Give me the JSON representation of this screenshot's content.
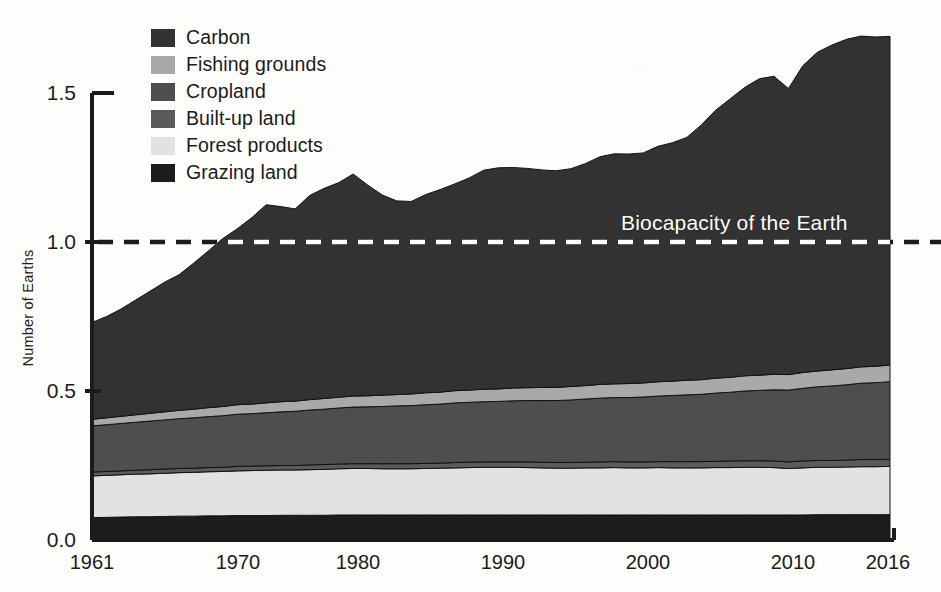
{
  "chart_data": {
    "type": "area",
    "stacked": true,
    "title": "",
    "xlabel": "",
    "ylabel": "Number of Earths",
    "xlim": [
      1961,
      2016
    ],
    "ylim": [
      0.0,
      1.75
    ],
    "yticks": [
      "0.0",
      "0.5",
      "1.0",
      "1.5"
    ],
    "ytick_values": [
      0.0,
      0.5,
      1.0,
      1.5
    ],
    "xticks": [
      "1961",
      "1970",
      "1980",
      "1990",
      "2000",
      "2010",
      "2016"
    ],
    "xtick_values": [
      1961,
      1970,
      1980,
      1990,
      2000,
      2010,
      2016
    ],
    "grid": false,
    "legend_position": "top-left",
    "x": [
      1961,
      1962,
      1963,
      1964,
      1965,
      1966,
      1967,
      1968,
      1969,
      1970,
      1971,
      1972,
      1973,
      1974,
      1975,
      1976,
      1977,
      1978,
      1979,
      1980,
      1981,
      1982,
      1983,
      1984,
      1985,
      1986,
      1987,
      1988,
      1989,
      1990,
      1991,
      1992,
      1993,
      1994,
      1995,
      1996,
      1997,
      1998,
      1999,
      2000,
      2001,
      2002,
      2003,
      2004,
      2005,
      2006,
      2007,
      2008,
      2009,
      2010,
      2011,
      2012,
      2013,
      2014,
      2015,
      2016
    ],
    "series": [
      {
        "name": "Grazing land",
        "color": "#1c1c1c",
        "values": [
          0.075,
          0.076,
          0.077,
          0.078,
          0.078,
          0.079,
          0.08,
          0.08,
          0.081,
          0.081,
          0.082,
          0.082,
          0.082,
          0.083,
          0.083,
          0.083,
          0.083,
          0.084,
          0.084,
          0.084,
          0.084,
          0.084,
          0.084,
          0.084,
          0.084,
          0.084,
          0.084,
          0.084,
          0.084,
          0.084,
          0.084,
          0.084,
          0.084,
          0.084,
          0.084,
          0.084,
          0.084,
          0.084,
          0.084,
          0.084,
          0.084,
          0.084,
          0.084,
          0.084,
          0.084,
          0.084,
          0.084,
          0.084,
          0.084,
          0.084,
          0.085,
          0.085,
          0.085,
          0.085,
          0.085,
          0.085
        ]
      },
      {
        "name": "Forest products",
        "color": "#e2e2e0",
        "values": [
          0.14,
          0.141,
          0.142,
          0.143,
          0.144,
          0.145,
          0.146,
          0.147,
          0.148,
          0.149,
          0.15,
          0.151,
          0.152,
          0.152,
          0.152,
          0.153,
          0.154,
          0.155,
          0.156,
          0.156,
          0.155,
          0.155,
          0.155,
          0.156,
          0.157,
          0.158,
          0.159,
          0.16,
          0.16,
          0.16,
          0.159,
          0.158,
          0.157,
          0.157,
          0.158,
          0.158,
          0.159,
          0.158,
          0.158,
          0.159,
          0.158,
          0.158,
          0.158,
          0.159,
          0.159,
          0.16,
          0.16,
          0.159,
          0.156,
          0.158,
          0.159,
          0.159,
          0.16,
          0.161,
          0.161,
          0.162
        ]
      },
      {
        "name": "Built-up land",
        "color": "#5b5b5b",
        "values": [
          0.013,
          0.013,
          0.013,
          0.013,
          0.014,
          0.014,
          0.014,
          0.014,
          0.014,
          0.014,
          0.015,
          0.015,
          0.015,
          0.015,
          0.015,
          0.016,
          0.016,
          0.016,
          0.016,
          0.016,
          0.017,
          0.017,
          0.017,
          0.017,
          0.017,
          0.018,
          0.018,
          0.018,
          0.018,
          0.018,
          0.019,
          0.019,
          0.019,
          0.019,
          0.019,
          0.02,
          0.02,
          0.02,
          0.02,
          0.02,
          0.021,
          0.021,
          0.021,
          0.021,
          0.022,
          0.022,
          0.022,
          0.022,
          0.022,
          0.023,
          0.023,
          0.023,
          0.023,
          0.024,
          0.024,
          0.024
        ]
      },
      {
        "name": "Cropland",
        "color": "#4e4e4e",
        "values": [
          0.155,
          0.157,
          0.159,
          0.161,
          0.163,
          0.165,
          0.167,
          0.169,
          0.171,
          0.173,
          0.175,
          0.176,
          0.178,
          0.18,
          0.182,
          0.184,
          0.186,
          0.188,
          0.19,
          0.191,
          0.192,
          0.194,
          0.195,
          0.197,
          0.198,
          0.2,
          0.201,
          0.202,
          0.203,
          0.205,
          0.206,
          0.207,
          0.208,
          0.21,
          0.212,
          0.214,
          0.215,
          0.216,
          0.218,
          0.22,
          0.222,
          0.224,
          0.226,
          0.229,
          0.231,
          0.234,
          0.236,
          0.239,
          0.241,
          0.244,
          0.247,
          0.25,
          0.253,
          0.256,
          0.258,
          0.26
        ]
      },
      {
        "name": "Fishing grounds",
        "color": "#a9a9a9",
        "values": [
          0.022,
          0.023,
          0.024,
          0.025,
          0.026,
          0.027,
          0.028,
          0.029,
          0.03,
          0.031,
          0.032,
          0.032,
          0.033,
          0.034,
          0.034,
          0.035,
          0.036,
          0.036,
          0.037,
          0.037,
          0.038,
          0.038,
          0.039,
          0.04,
          0.04,
          0.041,
          0.041,
          0.042,
          0.042,
          0.043,
          0.043,
          0.044,
          0.044,
          0.045,
          0.045,
          0.046,
          0.046,
          0.047,
          0.047,
          0.048,
          0.048,
          0.049,
          0.049,
          0.05,
          0.05,
          0.051,
          0.051,
          0.052,
          0.052,
          0.053,
          0.053,
          0.054,
          0.054,
          0.055,
          0.055,
          0.056
        ]
      },
      {
        "name": "Carbon",
        "color": "#323232",
        "values": [
          0.325,
          0.34,
          0.36,
          0.385,
          0.41,
          0.435,
          0.455,
          0.49,
          0.525,
          0.563,
          0.59,
          0.625,
          0.665,
          0.655,
          0.645,
          0.685,
          0.705,
          0.72,
          0.745,
          0.707,
          0.672,
          0.65,
          0.646,
          0.665,
          0.68,
          0.694,
          0.712,
          0.735,
          0.742,
          0.74,
          0.736,
          0.73,
          0.727,
          0.731,
          0.745,
          0.764,
          0.772,
          0.77,
          0.772,
          0.79,
          0.8,
          0.815,
          0.855,
          0.9,
          0.935,
          0.968,
          0.995,
          1.0,
          0.96,
          1.03,
          1.07,
          1.09,
          1.105,
          1.11,
          1.105,
          1.103
        ]
      }
    ],
    "totals": [
      0.73,
      0.75,
      0.775,
      0.805,
      0.835,
      0.865,
      0.89,
      0.929,
      0.969,
      1.011,
      1.044,
      1.081,
      1.125,
      1.119,
      1.111,
      1.156,
      1.18,
      1.199,
      1.228,
      1.191,
      1.158,
      1.138,
      1.136,
      1.159,
      1.176,
      1.195,
      1.215,
      1.241,
      1.249,
      1.25,
      1.247,
      1.242,
      1.239,
      1.246,
      1.263,
      1.286,
      1.296,
      1.295,
      1.299,
      1.321,
      1.333,
      1.351,
      1.393,
      1.443,
      1.481,
      1.519,
      1.548,
      1.556,
      1.515,
      1.592,
      1.637,
      1.661,
      1.68,
      1.691,
      1.688,
      1.69
    ],
    "annotations": [
      {
        "text": "Biocapacity of the Earth",
        "value": 1.0,
        "style": "dashed-line-with-white-label"
      }
    ],
    "legend_entries": [
      {
        "label": "Carbon",
        "color": "#323232"
      },
      {
        "label": "Fishing grounds",
        "color": "#a9a9a9"
      },
      {
        "label": "Cropland",
        "color": "#4e4e4e"
      },
      {
        "label": "Built-up land",
        "color": "#5b5b5b"
      },
      {
        "label": "Forest products",
        "color": "#e2e2e0"
      },
      {
        "label": "Grazing land",
        "color": "#1c1c1c"
      }
    ]
  },
  "axes": {
    "y_label": "Number of Earths",
    "y_ticks": [
      "1.5",
      "1.0",
      "0.5",
      "0.0"
    ],
    "x_ticks": [
      "1961",
      "1970",
      "1980",
      "1990",
      "2000",
      "2010",
      "2016"
    ]
  },
  "legend": {
    "items": [
      {
        "label": "Carbon"
      },
      {
        "label": "Fishing grounds"
      },
      {
        "label": "Cropland"
      },
      {
        "label": "Built-up land"
      },
      {
        "label": "Forest products"
      },
      {
        "label": "Grazing land"
      }
    ]
  },
  "annotation": {
    "biocapacity": "Biocapacity of the Earth"
  },
  "colors": {
    "carbon": "#323232",
    "fishing_grounds": "#a9a9a9",
    "cropland": "#4e4e4e",
    "built_up_land": "#5b5b5b",
    "forest_products": "#e2e2e0",
    "grazing_land": "#1c1c1c",
    "axis": "#1b1b1b",
    "background": "#fdfdfb",
    "annotation_text": "#ffffff"
  }
}
